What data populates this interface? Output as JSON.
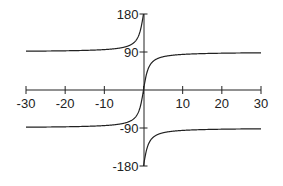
{
  "chart_data": {
    "type": "line",
    "title": "",
    "xlabel": "",
    "ylabel": "",
    "xlim": [
      -30,
      30
    ],
    "ylim": [
      -180,
      180
    ],
    "grid": false,
    "legend": null,
    "x_ticks": [
      -30,
      -20,
      -10,
      0,
      10,
      20,
      30
    ],
    "x_tick_labels": [
      "-30",
      "-20",
      "-10",
      "",
      "10",
      "20",
      "30"
    ],
    "y_ticks": [
      -180,
      -90,
      90,
      180
    ],
    "y_tick_labels": [
      "-180",
      "-90",
      "90",
      "180"
    ],
    "line_color": "#222222",
    "series": [
      {
        "name": "center-branch",
        "description": "arctan(x) in degrees, passes through origin, asymptotes -90 and +90",
        "x": [
          -30,
          -20,
          -10,
          -5,
          -3,
          -2,
          -1,
          -0.5,
          0,
          0.5,
          1,
          2,
          3,
          5,
          10,
          20,
          30
        ],
        "y": [
          -88.1,
          -87.1,
          -84.3,
          -78.7,
          -71.6,
          -63.4,
          -45,
          -26.6,
          0,
          26.6,
          45,
          63.4,
          71.6,
          78.7,
          84.3,
          87.1,
          88.1
        ]
      },
      {
        "name": "upper-left-branch",
        "description": "arctan(x)+180 for x<0, from ~92 at x=-30 rising to 180 at x=0",
        "x": [
          -30,
          -20,
          -10,
          -5,
          -3,
          -2,
          -1,
          -0.5,
          -0.1,
          0
        ],
        "y": [
          91.9,
          92.9,
          95.7,
          101.3,
          108.4,
          116.6,
          135,
          153.4,
          174.3,
          180
        ]
      },
      {
        "name": "lower-right-branch",
        "description": "arctan(x)-180 for x>0, from -180 at x=0 rising to ~-92 at x=30",
        "x": [
          0,
          0.1,
          0.5,
          1,
          2,
          3,
          5,
          10,
          20,
          30
        ],
        "y": [
          -180,
          -174.3,
          -153.4,
          -135,
          -116.6,
          -108.4,
          -101.3,
          -95.7,
          -92.9,
          -91.9
        ]
      }
    ]
  }
}
